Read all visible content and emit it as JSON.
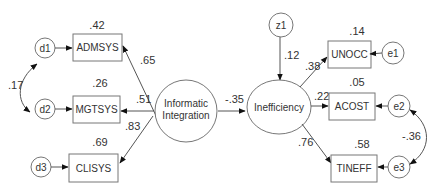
{
  "diagram": {
    "type": "structural-equation-model",
    "latent": {
      "info": {
        "line1": "Informatic",
        "line2": "Integration"
      },
      "ineff": {
        "label": "Inefficiency"
      }
    },
    "observed": {
      "admsys": {
        "label": "ADMSYS",
        "r2": ".42",
        "loading": ".65"
      },
      "mgtsys": {
        "label": "MGTSYS",
        "r2": ".26",
        "loading": ".51"
      },
      "clisys": {
        "label": "CLISYS",
        "r2": ".69",
        "loading": ".83"
      },
      "unocc": {
        "label": "UNOCC",
        "r2": ".14",
        "loading": ".38"
      },
      "acost": {
        "label": "ACOST",
        "r2": ".05",
        "loading": ".22"
      },
      "tineff": {
        "label": "TINEFF",
        "r2": ".58",
        "loading": ".76"
      }
    },
    "errors": {
      "d1": "d1",
      "d2": "d2",
      "d3": "d3",
      "e1": "e1",
      "e2": "e2",
      "e3": "e3",
      "z1": "z1"
    },
    "paths": {
      "structural": "-.35",
      "z1_r2": ".12",
      "cov_d1_d2": ".17",
      "cov_e2_e3": "-.36"
    }
  }
}
